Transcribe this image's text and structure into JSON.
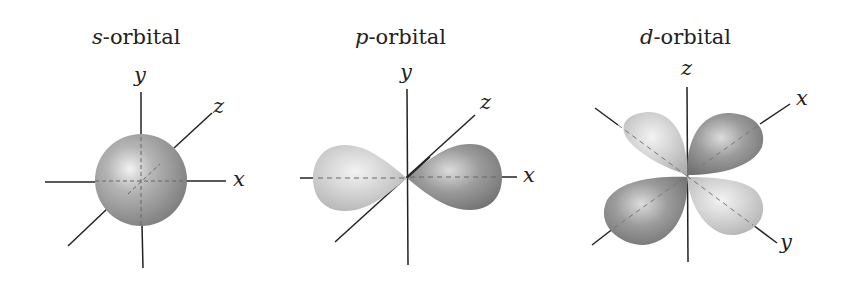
{
  "diagrams": [
    {
      "id": "s",
      "letter": "s",
      "suffix": "-orbital",
      "axes": {
        "vertical": "y",
        "diagonal": "z",
        "horizontal": "x"
      }
    },
    {
      "id": "p",
      "letter": "p",
      "suffix": "-orbital",
      "axes": {
        "vertical": "y",
        "diagonal": "z",
        "horizontal": "x"
      }
    },
    {
      "id": "d",
      "letter": "d",
      "suffix": "-orbital",
      "axes": {
        "vertical": "z",
        "diagonal_up": "x",
        "diagonal_down": "y"
      }
    }
  ],
  "colors": {
    "axis": "#222222",
    "lobe_light": "#c9c9c9",
    "lobe_dark": "#8a8a8a",
    "background": "#ffffff"
  }
}
